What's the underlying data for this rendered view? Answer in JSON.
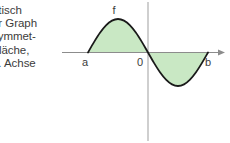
{
  "page": {
    "background_color": "#ffffff"
  },
  "text_block": {
    "name": "explanatory-text",
    "lines": [
      "ntisch",
      "er Graph",
      "symmet-",
      "Fläche,",
      "1. Achse"
    ]
  },
  "figure": {
    "title": "",
    "axis_color": "#8c8c8c",
    "curve_color": "#1a1a1a",
    "fill_color": "#c9e8c4",
    "divider_color": "#a8a8a8",
    "labels": {
      "function": "f",
      "left_bound": "a",
      "origin": "0",
      "right_bound": "b"
    }
  },
  "chart_data": {
    "type": "line",
    "title": "",
    "xlabel": "",
    "ylabel": "",
    "x_tick_labels": [
      "a",
      "0",
      "b"
    ],
    "x_tick_values": [
      -3.1416,
      0,
      3.1416
    ],
    "xlim": [
      -4.2,
      4.4
    ],
    "ylim": [
      -1.6,
      1.6
    ],
    "grid": false,
    "legend": null,
    "series": [
      {
        "name": "f",
        "x": [
          -3.1416,
          -2.8274,
          -2.5133,
          -2.1991,
          -1.885,
          -1.5708,
          -1.2566,
          -0.9425,
          -0.6283,
          -0.3142,
          0,
          0.3142,
          0.6283,
          0.9425,
          1.2566,
          1.5708,
          1.885,
          2.1991,
          2.5133,
          2.8274,
          3.1416
        ],
        "y": [
          0,
          0.309,
          0.588,
          0.809,
          0.951,
          1.0,
          0.951,
          0.809,
          0.588,
          0.309,
          0,
          -0.309,
          -0.588,
          -0.809,
          -0.951,
          -1.0,
          -0.951,
          -0.809,
          -0.588,
          -0.309,
          0
        ],
        "fill_to_zero": true
      }
    ],
    "annotations": [
      {
        "text": "f",
        "x": -1.5708,
        "y": 1.32
      },
      {
        "text": "a",
        "x": -3.1416,
        "y": -0.38
      },
      {
        "text": "0",
        "x": -0.33,
        "y": -0.38
      },
      {
        "text": "b",
        "x": 3.1416,
        "y": -0.38
      }
    ]
  }
}
